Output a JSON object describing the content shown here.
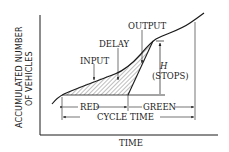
{
  "diagram": {
    "y_axis_label_line1": "ACCUMULATED NUMBER",
    "y_axis_label_line2": "OF VEHICLES",
    "x_axis_label": "TIME",
    "labels": {
      "input": "INPUT",
      "delay": "DELAY",
      "output": "OUTPUT",
      "h": "H",
      "stops": "(STOPS)",
      "red": "RED",
      "green": "GREEN",
      "cycle_time": "CYCLE TIME"
    },
    "colors": {
      "line": "#1a1a1a",
      "hatch": "#444444",
      "background": "#ffffff"
    }
  }
}
